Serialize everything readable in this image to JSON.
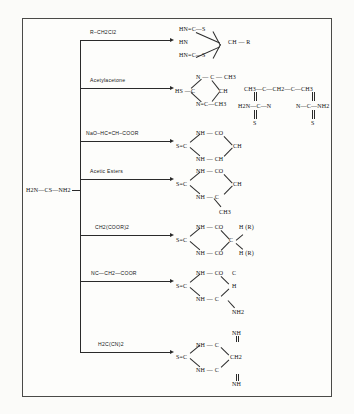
{
  "figure": {
    "type": "reaction-scheme",
    "substrate": {
      "label": "H2N—CS—NH2",
      "name": "thiourea"
    },
    "branches": [
      {
        "id": "branch-1",
        "reagent": "R–CH2Cl2",
        "product_name": "dithio bicyclic adduct",
        "lines": [
          "HN=C—S",
          "HN",
          "CH — R",
          "HN=C—S"
        ]
      },
      {
        "id": "branch-2",
        "reagent": "Acetylacetone",
        "product_name": "mercapto pyrimidine",
        "lines": [
          "N — C — CH3",
          "HS —C",
          "CH",
          "N=C—CH3"
        ],
        "side_product": {
          "top": "CH3—C—CH2—C—CH3",
          "mid_left": "H2N—C—N",
          "mid_right": "N—C—NH2",
          "s_left": "S",
          "s_right": "S"
        }
      },
      {
        "id": "branch-3",
        "reagent": "NaO–HC=CH–COOR",
        "product_name": "thiouracil",
        "lines": [
          "NH — CO",
          "S=C",
          "CH",
          "NH — CH"
        ]
      },
      {
        "id": "branch-4",
        "reagent": "Acetic Esters",
        "product_name": "methyl thiouracil",
        "lines": [
          "NH — CO",
          "S=C",
          "CH",
          "NH — C",
          "CH3"
        ]
      },
      {
        "id": "branch-5",
        "reagent": "CH2(COOR)2",
        "product_name": "thiobarbituric acid",
        "lines": [
          "NH — CO",
          "H (R)",
          "S=C",
          "C",
          "NH — CO",
          "H (R)"
        ]
      },
      {
        "id": "branch-6",
        "reagent": "NC—CH2—COOR",
        "product_name": "amino thiouracil",
        "lines": [
          "NH — CO",
          "S=C",
          "C",
          "H",
          "NH — C",
          "NH2"
        ]
      },
      {
        "id": "branch-7",
        "reagent": "H2C(CN)2",
        "product_name": "imino thiouracil",
        "lines": [
          "NH",
          "NH — C",
          "S=C",
          "CH2",
          "NH — C",
          "NH"
        ]
      }
    ]
  }
}
